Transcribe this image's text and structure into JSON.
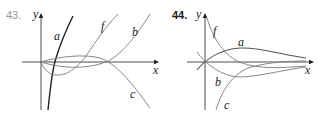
{
  "figures": [
    {
      "number": "43.",
      "axis_labels": {
        "x": "x",
        "y": "y"
      },
      "curves": [
        {
          "label": "a",
          "description": "steep increasing curve through origin region"
        },
        {
          "label": "f",
          "description": "cubic-like curve dipping below axis then rising"
        },
        {
          "label": "b",
          "description": "curve slightly below then rising after second root"
        },
        {
          "label": "c",
          "description": "curve slightly above axis then falling"
        }
      ]
    },
    {
      "number": "44.",
      "axis_labels": {
        "x": "x",
        "y": "y"
      },
      "curves": [
        {
          "label": "f",
          "description": "decreasing curve from top left approaching axis"
        },
        {
          "label": "a",
          "description": "hump curve rising from origin then decaying"
        },
        {
          "label": "b",
          "description": "dip curve below axis then approaching axis"
        },
        {
          "label": "c",
          "description": "increasing curve from below approaching axis"
        }
      ]
    }
  ]
}
